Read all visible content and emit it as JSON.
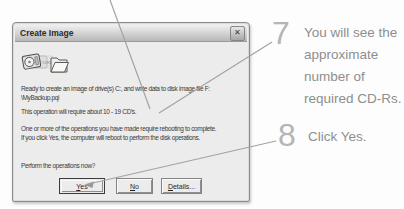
{
  "window": {
    "title": "Create Image",
    "close_icon_glyph": "✕"
  },
  "dialog": {
    "message_line1": "Ready to create an image of drive(s) C:, and write data to disk image file F:",
    "message_line2": "\\MyBackup.pqi",
    "cd_estimate": "This operation will require about 10 - 19 CD's.",
    "reboot_line1": "One or more of the operations you have made require rebooting to complete.",
    "reboot_line2": "If you click Yes, the computer will reboot to perform the disk operations.",
    "question": "Perform the operations now?",
    "icon_digits": "1389",
    "buttons": {
      "yes": {
        "accel": "Y",
        "rest": "es"
      },
      "no": {
        "accel": "N",
        "rest": "o"
      },
      "details": {
        "accel": "D",
        "rest": "etails..."
      }
    }
  },
  "steps": [
    {
      "number": "7",
      "lines": [
        "You will see the",
        "approximate",
        "number of",
        "required CD-Rs."
      ]
    },
    {
      "number": "8",
      "lines": [
        "Click Yes."
      ]
    }
  ],
  "colors": {
    "dialog_body": "#ececec",
    "titlebar_top": "#f0f0f0",
    "titlebar_bottom": "#b8b8b8",
    "dialog_text": "#3a3a3a",
    "step_number": "#b5b5b5",
    "step_text": "#8e8e8e",
    "callout_line": "#a3a3a3"
  }
}
